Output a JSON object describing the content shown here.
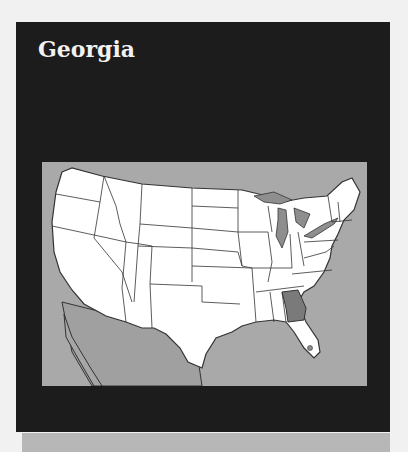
{
  "card": {
    "title": "Georgia"
  },
  "map": {
    "region": "Contiguous United States",
    "highlighted_state": "Georgia",
    "colors": {
      "panel": "#1c1c1c",
      "water": "#a9a9a9",
      "land": "#ffffff",
      "highlight": "#7a7a7a",
      "border": "#333333"
    }
  }
}
